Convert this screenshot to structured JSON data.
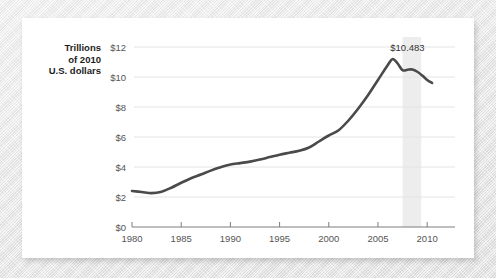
{
  "chart_data": {
    "type": "line",
    "title": "",
    "subtitle": "",
    "ylabel_lines": [
      "Trillions",
      "of 2010",
      "U.S. dollars"
    ],
    "xlabel": "",
    "xlim": [
      1980,
      2011
    ],
    "ylim": [
      0,
      12
    ],
    "grid": true,
    "legend": "none",
    "line_color": "#4a4a4a",
    "shade_color": "#ededed",
    "gridline_color": "#e4e4e4",
    "axis_color": "#7d7d7d",
    "x_ticks": [
      "1980",
      "1985",
      "1990",
      "1995",
      "2000",
      "2005",
      "2010"
    ],
    "x_tick_values": [
      1980,
      1985,
      1990,
      1995,
      2000,
      2005,
      2010
    ],
    "y_ticks": [
      "$0",
      "$2",
      "$4",
      "$6",
      "$8",
      "$10",
      "$12"
    ],
    "y_tick_values": [
      0,
      2,
      4,
      6,
      8,
      10,
      12
    ],
    "series": [
      {
        "name": "Real household debt",
        "x": [
          1980,
          1981,
          1982,
          1983,
          1984,
          1985,
          1986,
          1987,
          1988,
          1989,
          1990,
          1991,
          1992,
          1993,
          1994,
          1995,
          1996,
          1997,
          1998,
          1999,
          2000,
          2001,
          2002,
          2003,
          2004,
          2005,
          2006,
          2006.5,
          2007,
          2007.5,
          2008,
          2008.5,
          2009,
          2009.5,
          2010,
          2010.5
        ],
        "values": [
          2.4,
          2.33,
          2.26,
          2.35,
          2.62,
          2.95,
          3.25,
          3.5,
          3.76,
          3.98,
          4.16,
          4.26,
          4.36,
          4.5,
          4.66,
          4.82,
          4.95,
          5.08,
          5.3,
          5.7,
          6.1,
          6.45,
          7.1,
          7.9,
          8.8,
          9.8,
          10.8,
          11.2,
          10.9,
          10.45,
          10.483,
          10.5,
          10.35,
          10.1,
          9.8,
          9.6
        ]
      }
    ],
    "annotations": [
      {
        "label": "$10.483",
        "x": 2008,
        "y": 10.483
      }
    ],
    "shaded_regions": [
      {
        "name": "recession-band",
        "x_start": 2007.5,
        "x_end": 2009.4
      }
    ]
  }
}
